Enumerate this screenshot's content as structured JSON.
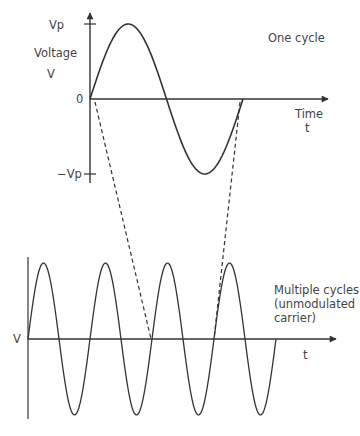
{
  "top_panel": {
    "labels": {
      "vp": "Vp",
      "voltage": "Voltage",
      "v": "V",
      "zero": "0",
      "neg_vp": "−Vp",
      "time": "Time",
      "t": "t",
      "title": "One cycle"
    },
    "wave": {
      "origin_x": 90,
      "axis_y": 99,
      "amplitude": 75,
      "period": 153,
      "cycles": 1
    },
    "axes": {
      "y_axis": {
        "x": 90,
        "top": 13,
        "bottom": 183,
        "ticks": [
          {
            "label": "Vp",
            "y": 24
          },
          {
            "label": "-Vp",
            "y": 174
          }
        ]
      },
      "x_axis": {
        "y": 99,
        "left": 90,
        "right": 328
      }
    }
  },
  "bottom_panel": {
    "labels": {
      "v": "V",
      "t": "t",
      "title": "Multiple cycles\n(unmodulated\ncarrier)"
    },
    "wave": {
      "origin_x": 28,
      "axis_y": 339,
      "amplitude": 76,
      "period": 62,
      "cycles": 4
    },
    "axes": {
      "y_axis": {
        "x": 28,
        "top": 257,
        "bottom": 419
      },
      "x_axis": {
        "y": 339,
        "left": 28,
        "right": 336
      }
    }
  },
  "projection_lines": [
    {
      "from": [
        95,
        102
      ],
      "to": [
        151,
        339
      ],
      "style": "dashed"
    },
    {
      "from": [
        240,
        102
      ],
      "to": [
        214,
        339
      ],
      "style": "dashed"
    }
  ],
  "colors": {
    "line": "#3a3a3a",
    "text": "#444444",
    "background": "#ffffff"
  }
}
